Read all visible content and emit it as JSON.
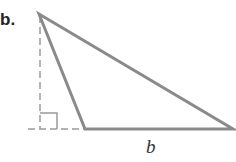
{
  "figure": {
    "part_label": "b.",
    "base_label": "b",
    "colors": {
      "triangle_stroke": "#8a8a8a",
      "dashed_stroke": "#9a9a9a",
      "text": "#222222"
    }
  }
}
